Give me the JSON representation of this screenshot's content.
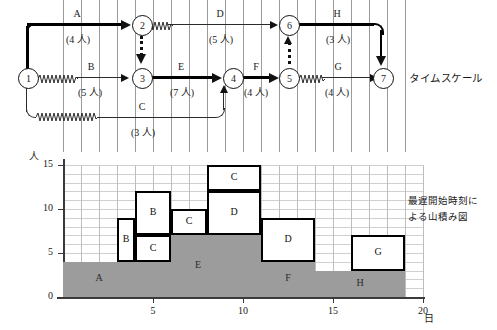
{
  "figure": {
    "network_caption": "タイムスケール",
    "histogram_caption_line1": "最遅開始時刻に",
    "histogram_caption_line2": "よる山積み図"
  },
  "network": {
    "nodes": [
      {
        "id": "1",
        "x": 18,
        "y": 68
      },
      {
        "id": "2",
        "x": 132,
        "y": 15
      },
      {
        "id": "3",
        "x": 132,
        "y": 68
      },
      {
        "id": "4",
        "x": 223,
        "y": 68
      },
      {
        "id": "5",
        "x": 279,
        "y": 68
      },
      {
        "id": "6",
        "x": 279,
        "y": 15
      },
      {
        "id": "7",
        "x": 373,
        "y": 68
      }
    ],
    "activities": [
      {
        "name": "A",
        "resource": "(4 人)"
      },
      {
        "name": "B",
        "resource": "(5 人)"
      },
      {
        "name": "C",
        "resource": "(3 人)"
      },
      {
        "name": "D",
        "resource": "(5 人)"
      },
      {
        "name": "E",
        "resource": "(7 人)"
      },
      {
        "name": "F",
        "resource": "(4 人)"
      },
      {
        "name": "G",
        "resource": "(4 人)"
      },
      {
        "name": "H",
        "resource": "(3 人)"
      }
    ]
  },
  "chart_data": {
    "type": "bar",
    "xlabel": "日",
    "ylabel": "人",
    "xlim": [
      0,
      20
    ],
    "ylim": [
      0,
      15
    ],
    "x_ticks": [
      "5",
      "10",
      "15",
      "20"
    ],
    "x_tick_values": [
      5,
      10,
      15,
      20
    ],
    "y_ticks": [
      "0",
      "5",
      "10",
      "15"
    ],
    "y_tick_values": [
      0,
      5,
      10,
      15
    ],
    "grid": true,
    "legend": "none",
    "blocks": [
      {
        "label": "A",
        "start": 0,
        "end": 4,
        "base": 0,
        "top": 4,
        "shaded": true
      },
      {
        "label": "B",
        "start": 3,
        "end": 4,
        "base": 4,
        "top": 9,
        "shaded": false
      },
      {
        "label": "B",
        "start": 4,
        "end": 6,
        "base": 7,
        "top": 12,
        "shaded": false
      },
      {
        "label": "C",
        "start": 4,
        "end": 6,
        "base": 4,
        "top": 7,
        "shaded": false
      },
      {
        "label": "C",
        "start": 6,
        "end": 8,
        "base": 7,
        "top": 10,
        "shaded": false
      },
      {
        "label": "E",
        "start": 4,
        "end": 11,
        "base": 0,
        "top": 7,
        "shaded": true
      },
      {
        "label": "C",
        "start": 8,
        "end": 11,
        "base": 12,
        "top": 15,
        "shaded": false
      },
      {
        "label": "D",
        "start": 8,
        "end": 11,
        "base": 7,
        "top": 12,
        "shaded": false
      },
      {
        "label": "D",
        "start": 11,
        "end": 14,
        "base": 4,
        "top": 9,
        "shaded": false
      },
      {
        "label": "F",
        "start": 11,
        "end": 14,
        "base": 0,
        "top": 4,
        "shaded": true
      },
      {
        "label": "H",
        "start": 14,
        "end": 19,
        "base": 0,
        "top": 3,
        "shaded": true
      },
      {
        "label": "G",
        "start": 16,
        "end": 19,
        "base": 3,
        "top": 7,
        "shaded": false
      }
    ]
  }
}
